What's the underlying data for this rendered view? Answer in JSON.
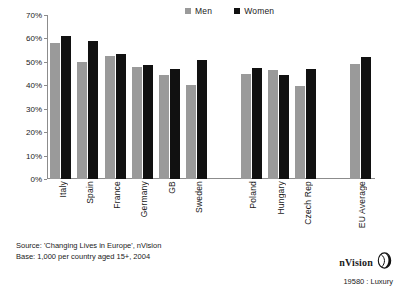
{
  "chart_data": {
    "type": "bar",
    "title": "",
    "xlabel": "",
    "ylabel": "",
    "ylim": [
      0,
      70
    ],
    "ytick_step": 10,
    "ytick_labels": [
      "0%",
      "10%",
      "20%",
      "30%",
      "40%",
      "50%",
      "60%",
      "70%"
    ],
    "grid": false,
    "legend_position": "top-center",
    "categories": [
      "Italy",
      "Spain",
      "France",
      "Germany",
      "GB",
      "Sweden",
      "",
      "Poland",
      "Hungary",
      "Czech Rep",
      "",
      "EU Average"
    ],
    "series": [
      {
        "name": "Men",
        "color": "#9a9a9a",
        "values": [
          58,
          50,
          52.5,
          48,
          44.5,
          40,
          null,
          45,
          46.5,
          39.5,
          null,
          49
        ]
      },
      {
        "name": "Women",
        "color": "#111111",
        "values": [
          61,
          59,
          53.5,
          48.5,
          47,
          51,
          null,
          47.5,
          44.5,
          47,
          null,
          52
        ]
      }
    ]
  },
  "legend": {
    "entries": [
      {
        "label": "Men",
        "color": "#9a9a9a",
        "swatch_icon": "square-swatch-icon"
      },
      {
        "label": "Women",
        "color": "#111111",
        "swatch_icon": "square-swatch-icon"
      }
    ]
  },
  "footer": {
    "source_line": "Source: 'Changing Lives in Europe', nVision",
    "base_line": "Base: 1,000 per country aged 15+, 2004"
  },
  "brand": {
    "name": "nVision",
    "logo_icon": "nvision-sphere-logo-icon",
    "reference": "19580 : Luxury"
  }
}
